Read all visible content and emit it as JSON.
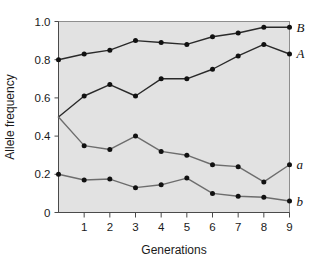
{
  "chart_data": {
    "type": "line",
    "title": "",
    "xlabel": "Generations",
    "ylabel": "Allele frequency",
    "xlim": [
      0,
      9
    ],
    "ylim": [
      0,
      1.0
    ],
    "grid": false,
    "legend_position": "right-inline",
    "x": [
      0,
      1,
      2,
      3,
      4,
      5,
      6,
      7,
      8,
      9
    ],
    "xticklabels": [
      "1",
      "2",
      "3",
      "4",
      "5",
      "6",
      "7",
      "8",
      "9"
    ],
    "xtickvalues": [
      1,
      2,
      3,
      4,
      5,
      6,
      7,
      8,
      9
    ],
    "yticklabels": [
      "0",
      "0.2",
      "0.4",
      "0.6",
      "0.8",
      "1.0"
    ],
    "ytickvalues": [
      0,
      0.2,
      0.4,
      0.6,
      0.8,
      1.0
    ],
    "series": [
      {
        "name": "B",
        "label": "B",
        "color": "#2a2a2a",
        "values": [
          0.8,
          0.83,
          0.85,
          0.9,
          0.89,
          0.88,
          0.92,
          0.94,
          0.97,
          0.97
        ]
      },
      {
        "name": "A",
        "label": "A",
        "color": "#2a2a2a",
        "values": [
          0.5,
          0.61,
          0.67,
          0.61,
          0.7,
          0.7,
          0.75,
          0.82,
          0.88,
          0.83
        ]
      },
      {
        "name": "a",
        "label": "a",
        "color": "#6d6d6d",
        "values": [
          0.5,
          0.35,
          0.33,
          0.4,
          0.32,
          0.3,
          0.25,
          0.24,
          0.16,
          0.25
        ]
      },
      {
        "name": "b",
        "label": "b",
        "color": "#6d6d6d",
        "values": [
          0.2,
          0.17,
          0.175,
          0.13,
          0.145,
          0.18,
          0.1,
          0.085,
          0.08,
          0.06
        ]
      }
    ]
  },
  "colors": {
    "plot_background": "#e2e2e2",
    "plot_border": "#8e8e8e",
    "page_background": "#ffffff",
    "text": "#1a1a1a",
    "marker": "#111111"
  }
}
